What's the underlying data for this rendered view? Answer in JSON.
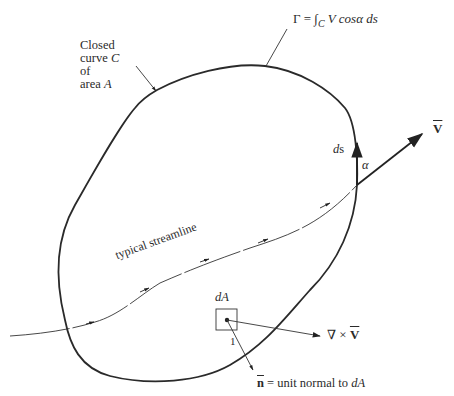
{
  "diagram": {
    "type": "circulation-stokes-theorem",
    "labels": {
      "closed_curve_line1": "Closed",
      "closed_curve_line2": "curve",
      "closed_curve_c": "C",
      "closed_curve_line3": "of",
      "closed_curve_line4": "area",
      "closed_curve_a": "A",
      "circulation_gamma": "Γ = ∫",
      "circulation_sub": "C",
      "circulation_rest": " V cosα ds",
      "ds_d": "d",
      "ds_s": "s",
      "alpha": "α",
      "velocity": "V",
      "streamline": "typical streamline",
      "dA": "dA",
      "one": "1",
      "curl_nabla": "∇ × ",
      "curl_v": "V",
      "normal_n": "n",
      "normal_text": " = unit normal to ",
      "normal_dA": "dA"
    },
    "colors": {
      "line": "#2a2a2a",
      "thin_line": "#444444",
      "background": "#ffffff"
    }
  }
}
